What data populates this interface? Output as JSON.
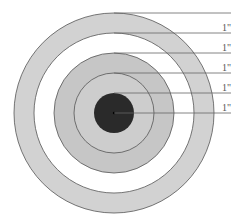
{
  "diagram": {
    "title": "",
    "center": {
      "x": 114,
      "y": 113
    },
    "rings": [
      {
        "name": "ring-5-outer",
        "radius": 100,
        "fill": "#d2d2d2"
      },
      {
        "name": "ring-4",
        "radius": 80,
        "fill": "#ffffff"
      },
      {
        "name": "ring-3",
        "radius": 60,
        "fill": "#c6c6c6"
      },
      {
        "name": "ring-2",
        "radius": 40,
        "fill": "#cdcdcd"
      },
      {
        "name": "bullseye",
        "radius": 20,
        "fill": "#2a2a2a"
      }
    ],
    "dimension_labels": [
      {
        "text": "1\"",
        "y": 27
      },
      {
        "text": "1\"",
        "y": 47
      },
      {
        "text": "1\"",
        "y": 67
      },
      {
        "text": "1\"",
        "y": 87
      },
      {
        "text": "1\"",
        "y": 107
      }
    ],
    "leader_line_end_x": 231,
    "stroke_color": "#555555"
  }
}
